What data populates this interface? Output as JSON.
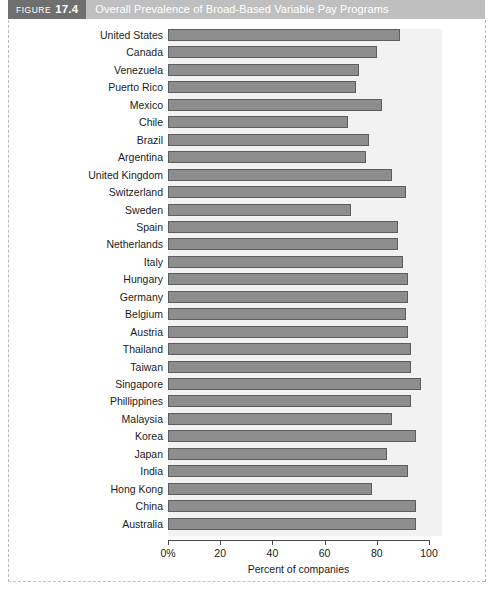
{
  "header": {
    "figure_word": "FIGURE",
    "figure_number": "17.4",
    "title": "Overall Prevalence of Broad-Based Variable Pay Programs",
    "tag_bg": "#6f6f6f",
    "title_bg": "#bfbfbf"
  },
  "chart_data": {
    "type": "bar",
    "orientation": "horizontal",
    "title": "Overall Prevalence of Broad-Based Variable Pay Programs",
    "xlabel": "Percent of companies",
    "ylabel": "",
    "xlim": [
      0,
      100
    ],
    "xticks": [
      0,
      20,
      40,
      60,
      80,
      100
    ],
    "xtick_labels": [
      "0%",
      "20",
      "40",
      "60",
      "80",
      "100"
    ],
    "grid": false,
    "legend": false,
    "bar_color": "#8d8d8d",
    "bar_edge_color": "#5d5d5d",
    "plot_bg": "#f2f2f2",
    "categories": [
      "United States",
      "Canada",
      "Venezuela",
      "Puerto Rico",
      "Mexico",
      "Chile",
      "Brazil",
      "Argentina",
      "United Kingdom",
      "Switzerland",
      "Sweden",
      "Spain",
      "Netherlands",
      "Italy",
      "Hungary",
      "Germany",
      "Belgium",
      "Austria",
      "Thailand",
      "Taiwan",
      "Singapore",
      "Phillippines",
      "Malaysia",
      "Korea",
      "Japan",
      "India",
      "Hong Kong",
      "China",
      "Australia"
    ],
    "values": [
      89,
      80,
      73,
      72,
      82,
      69,
      77,
      76,
      86,
      91,
      70,
      88,
      88,
      90,
      92,
      92,
      91,
      92,
      93,
      93,
      97,
      93,
      86,
      95,
      84,
      92,
      78,
      95,
      95
    ]
  }
}
